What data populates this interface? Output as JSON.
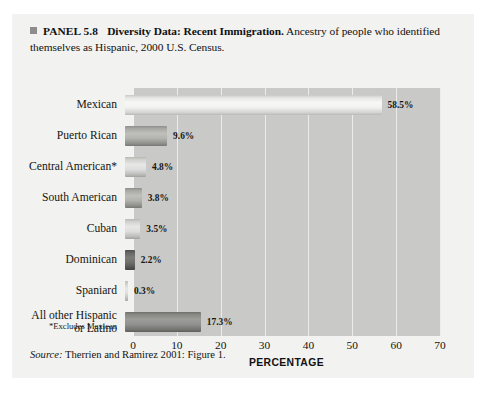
{
  "panel": {
    "bullet_icon": "square-bullet-icon",
    "number": "PANEL 5.8",
    "headline": "Diversity Data: Recent Immigration.",
    "description": " Ancestry of people who identified themselves as Hispanic, 2000 U.S. Census.",
    "source_label": "Source:",
    "source_text": " Therrien and Ramirez 2001: Figure 1.",
    "footnote": "*Excludes Mexican",
    "background_color": "#f2f2f0",
    "plot_background_color": "#c9c9c7"
  },
  "chart_data": {
    "type": "bar",
    "orientation": "horizontal",
    "title": "Diversity Data: Recent Immigration",
    "xlabel": "PERCENTAGE",
    "ylabel": "",
    "xlim": [
      0,
      70
    ],
    "xticks": [
      0,
      10,
      20,
      30,
      40,
      50,
      60,
      70
    ],
    "xtick_labels": [
      "0",
      "10",
      "20",
      "30",
      "40",
      "50",
      "60",
      "70"
    ],
    "grid": true,
    "legend": "none",
    "categories": [
      "Mexican",
      "Puerto Rican",
      "Central American*",
      "South American",
      "Cuban",
      "Dominican",
      "Spaniard",
      "All other Hispanic\nor Latino"
    ],
    "values": [
      58.5,
      9.6,
      4.8,
      3.8,
      3.5,
      2.2,
      0.3,
      17.3
    ],
    "value_labels": [
      "58.5%",
      "9.6%",
      "4.8%",
      "3.8%",
      "3.5%",
      "2.2%",
      "0.3%",
      "17.3%"
    ],
    "bar_shades": [
      "light",
      "mid",
      "midlight",
      "mid",
      "midlight",
      "dark",
      "midlight",
      "deep"
    ]
  }
}
